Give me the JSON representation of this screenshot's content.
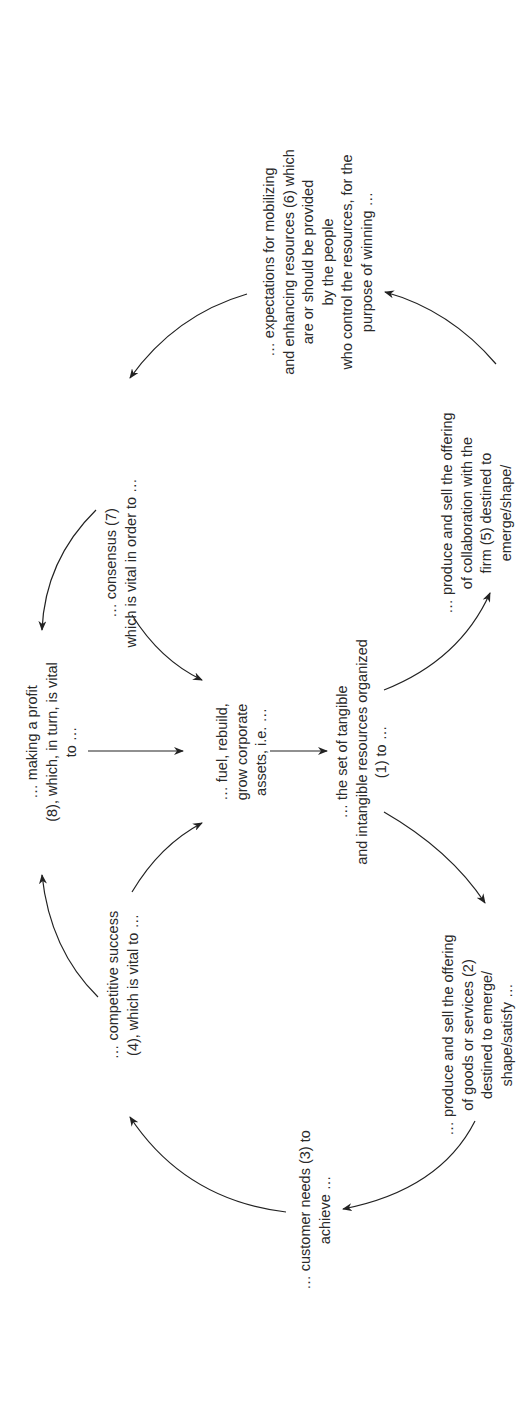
{
  "diagram": {
    "orientation": "rotated -90 degrees",
    "nodes": {
      "fuel": {
        "lines": [
          "… fuel, rebuild,",
          "grow corporate",
          "assets, i.e. …"
        ]
      },
      "resources": {
        "lines": [
          "… the set of tangible",
          "and intangible resources organized",
          "(1) to …"
        ]
      },
      "offering_goods": {
        "lines": [
          "… produce and sell the offering",
          "of goods or services (2)",
          "destined to emerge/",
          "shape/satisfy …"
        ]
      },
      "customer_needs": {
        "lines": [
          "… customer needs (3) to",
          "achieve …"
        ]
      },
      "competitive_success": {
        "lines": [
          "… competitive success",
          "(4), which is vital to …"
        ]
      },
      "profit": {
        "lines": [
          "… making a profit",
          "(8), which, in turn, is vital",
          "to …"
        ]
      },
      "consensus": {
        "lines": [
          "… consensus (7)",
          "which is vital in order to …"
        ]
      },
      "expectations": {
        "lines": [
          "… expectations for mobilizing",
          "and enhancing resources (6) which",
          "are or should be provided",
          "by the people",
          "who control the resources, for the",
          "purpose of winning …"
        ]
      },
      "offering_collab": {
        "lines": [
          "… produce and sell the offering",
          "of collaboration with the",
          "firm (5) destined to",
          "emerge/shape/"
        ]
      }
    },
    "edges": [
      {
        "from": "profit",
        "to": "fuel"
      },
      {
        "from": "fuel",
        "to": "resources"
      },
      {
        "from": "resources",
        "to": "offering_goods"
      },
      {
        "from": "offering_goods",
        "to": "customer_needs"
      },
      {
        "from": "customer_needs",
        "to": "competitive_success"
      },
      {
        "from": "competitive_success",
        "to": "profit"
      },
      {
        "from": "competitive_success",
        "to": "fuel"
      },
      {
        "from": "resources",
        "to": "offering_collab"
      },
      {
        "from": "offering_collab",
        "to": "expectations"
      },
      {
        "from": "expectations",
        "to": "consensus"
      },
      {
        "from": "consensus",
        "to": "profit"
      },
      {
        "from": "consensus",
        "to": "fuel"
      }
    ],
    "colors": {
      "text": "#2a2a2a",
      "line": "#222222",
      "background": "#ffffff"
    }
  }
}
